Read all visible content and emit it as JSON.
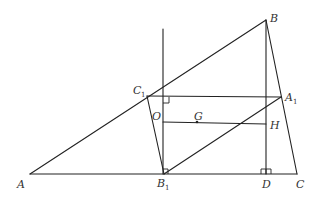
{
  "figure": {
    "type": "geometry",
    "points": {
      "A": {
        "label": "A",
        "sub": "",
        "x": 30,
        "y": 174
      },
      "B": {
        "label": "B",
        "sub": "",
        "x": 266,
        "y": 20
      },
      "C": {
        "label": "C",
        "sub": "",
        "x": 297,
        "y": 174
      },
      "A1": {
        "label": "A",
        "sub": "1",
        "x": 281,
        "y": 97
      },
      "B1": {
        "label": "B",
        "sub": "1",
        "x": 164,
        "y": 174
      },
      "C1": {
        "label": "C",
        "sub": "1",
        "x": 147,
        "y": 96
      },
      "D": {
        "label": "D",
        "sub": "",
        "x": 266,
        "y": 174
      },
      "O": {
        "label": "O",
        "sub": "",
        "x": 163,
        "y": 122
      },
      "G": {
        "label": "G",
        "sub": "",
        "x": 197,
        "y": 122
      },
      "H": {
        "label": "H",
        "sub": "",
        "x": 266,
        "y": 124
      }
    },
    "labels": {
      "A": "A",
      "B": "B",
      "C": "C",
      "A1": "A",
      "A1_sub": "1",
      "B1": "B",
      "B1_sub": "1",
      "C1": "C",
      "C1_sub": "1",
      "D": "D",
      "O": "O",
      "G": "G",
      "H": "H"
    },
    "segments": [
      [
        "A",
        "B"
      ],
      [
        "B",
        "C"
      ],
      [
        "A",
        "C"
      ],
      [
        "C1",
        "A1"
      ],
      [
        "C1",
        "B1"
      ],
      [
        "B1",
        "A1"
      ],
      [
        "B",
        "D"
      ],
      [
        "O",
        "H"
      ],
      [
        "perp_top",
        "B1"
      ]
    ],
    "right_angles": [
      "C1A1 ⟂ vertical at (163,97)",
      "BD ⟂ AC at D",
      "vertical ⟂ AC at B1"
    ],
    "stroke_color": "#222222",
    "label_color": "#333333"
  }
}
